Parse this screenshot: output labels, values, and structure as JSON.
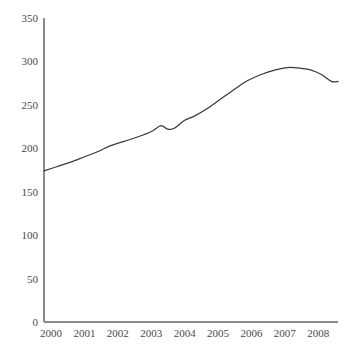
{
  "chart_data": {
    "type": "line",
    "title": "",
    "subtitle": "",
    "xlabel": "",
    "ylabel": "",
    "xlim": [
      2000,
      2008.8
    ],
    "ylim": [
      0,
      350
    ],
    "grid": false,
    "legend": false,
    "legend_position": "none",
    "y_ticks": [
      0,
      50,
      100,
      150,
      200,
      250,
      300,
      350
    ],
    "y_tick_labels": [
      "0",
      "50",
      "100",
      "150",
      "200",
      "250",
      "300",
      "350"
    ],
    "x_ticks": [
      2000,
      2001,
      2002,
      2003,
      2004,
      2005,
      2006,
      2007,
      2008
    ],
    "x_tick_labels": [
      "2000",
      "2001",
      "2002",
      "2003",
      "2004",
      "2005",
      "2006",
      "2007",
      "2008"
    ],
    "series": [
      {
        "name": "series-1",
        "color": "#3a3a3a",
        "x": [
          2000.0,
          2000.4,
          2000.8,
          2001.2,
          2001.6,
          2002.0,
          2002.4,
          2002.8,
          2003.2,
          2003.5,
          2003.7,
          2003.9,
          2004.2,
          2004.5,
          2004.9,
          2005.3,
          2005.7,
          2006.1,
          2006.5,
          2006.9,
          2007.3,
          2007.7,
          2008.0,
          2008.3,
          2008.6,
          2008.8
        ],
        "y": [
          174,
          179,
          184,
          190,
          196,
          203,
          208,
          213,
          219,
          226,
          222,
          223,
          232,
          237,
          246,
          257,
          268,
          278,
          285,
          290,
          293,
          292,
          290,
          285,
          277,
          277
        ]
      }
    ]
  },
  "axes": {
    "y_axis_name": "y-axis",
    "x_axis_name": "x-axis"
  }
}
